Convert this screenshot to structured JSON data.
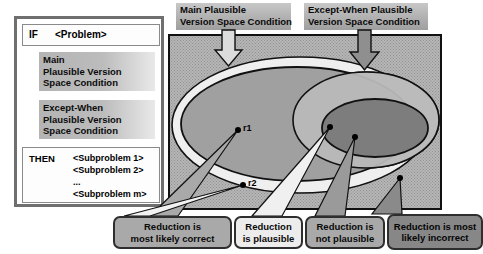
{
  "rule_box": {
    "if_keyword": "IF",
    "if_value": "<Problem>",
    "main_condition": {
      "line1": "Main",
      "line2": "Plausible Version",
      "line3": "Space Condition"
    },
    "except_when_condition": {
      "line1": "Except-When",
      "line2": "Plausible Version",
      "line3": "Space  Condition"
    },
    "then_keyword": "THEN",
    "subproblems": [
      "<Subproblem 1>",
      "<Subproblem 2>",
      "...",
      "<Subproblem m>"
    ]
  },
  "top_labels": {
    "main": {
      "line1": "Main Plausible",
      "line2": "Version Space Condition"
    },
    "except_when": {
      "line1": "Except-When Plausible",
      "line2": "Version Space  Condition"
    }
  },
  "diagram": {
    "points": [
      {
        "id": "r1",
        "label": "r1",
        "x": 238,
        "y": 130
      },
      {
        "id": "r2",
        "label": "r2",
        "x": 243,
        "y": 185
      },
      {
        "id": "p3",
        "label": "",
        "x": 330,
        "y": 127
      },
      {
        "id": "p4",
        "label": "",
        "x": 355,
        "y": 137
      },
      {
        "id": "p5",
        "label": "",
        "x": 400,
        "y": 178
      }
    ],
    "arrows": [
      {
        "name": "main-arrow",
        "color": "#d8d8d8"
      },
      {
        "name": "except-when-arrow",
        "color": "#8f8f8f"
      }
    ],
    "regions": [
      {
        "name": "main-plausible-outer",
        "fill": "#efefef"
      },
      {
        "name": "main-plausible-inner",
        "fill": "#a0a0a0"
      },
      {
        "name": "except-when-outer",
        "fill": "#cfcfcf"
      },
      {
        "name": "except-when-inner",
        "fill": "#7d7d7d"
      }
    ]
  },
  "callouts": [
    {
      "id": "callout-most-likely-correct",
      "line1": "Reduction is",
      "line2": "most likely correct",
      "bg": "#a9a9a9"
    },
    {
      "id": "callout-plausible",
      "line1": "Reduction",
      "line2": "is plausible",
      "bg": "#ececec"
    },
    {
      "id": "callout-not-plausible",
      "line1": "Reduction is",
      "line2": "not plausible",
      "bg": "#a9a9a9"
    },
    {
      "id": "callout-most-likely-incorrect",
      "line1": "Reduction is most",
      "line2": "likely incorrect",
      "bg": "#878787"
    }
  ]
}
